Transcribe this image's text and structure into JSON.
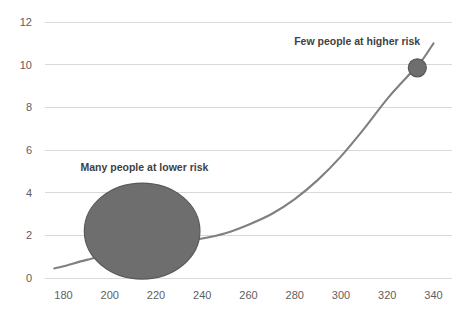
{
  "chart_data": {
    "type": "line",
    "title": "",
    "xlabel": "",
    "ylabel": "",
    "xlim": [
      172,
      348
    ],
    "ylim": [
      0,
      12
    ],
    "grid": true,
    "legend": false,
    "x_ticks": [
      180,
      200,
      220,
      240,
      260,
      280,
      300,
      320,
      340
    ],
    "y_ticks": [
      0,
      2,
      4,
      6,
      8,
      10,
      12
    ],
    "series": [
      {
        "name": "risk-curve",
        "color": "#808080",
        "x": [
          176,
          180,
          190,
          200,
          210,
          220,
          230,
          240,
          250,
          260,
          270,
          280,
          290,
          300,
          310,
          320,
          330,
          335,
          340
        ],
        "values": [
          0.45,
          0.55,
          0.85,
          1.1,
          1.35,
          1.55,
          1.7,
          1.85,
          2.1,
          2.5,
          3.0,
          3.7,
          4.6,
          5.7,
          7.0,
          8.4,
          9.6,
          10.2,
          11.0
        ]
      }
    ],
    "markers": [
      {
        "name": "high-risk-point",
        "x": 333,
        "y": 9.85,
        "color": "#6e6e6e",
        "radius_px": 9,
        "label": "Few people at higher risk"
      }
    ],
    "shapes": [
      {
        "name": "low-risk-population-ellipse",
        "type": "ellipse",
        "center_x": 214,
        "center_y": 2.2,
        "rx_units": 25,
        "ry_units": 2.25,
        "color": "#6e6e6e",
        "label": "Many people at lower risk"
      }
    ],
    "annotations": [
      {
        "text": "Many people at lower risk",
        "x": 215,
        "y": 5.0
      },
      {
        "text": "Few people at higher risk",
        "x": 307,
        "y": 10.9
      }
    ],
    "colors": {
      "gridline": "#d9d9d9",
      "tick_text": "#5e5e5e",
      "annotation_text": "#3f3f3f",
      "curve": "#808080",
      "shape_fill": "#6e6e6e",
      "shape_stroke": "#595959",
      "background": "#ffffff"
    }
  },
  "axes": {
    "y_tick_labels": [
      "0",
      "2",
      "4",
      "6",
      "8",
      "10",
      "12"
    ],
    "x_tick_labels": [
      "180",
      "200",
      "220",
      "240",
      "260",
      "280",
      "300",
      "320",
      "340"
    ]
  },
  "annotations": {
    "low_risk": "Many people at lower risk",
    "high_risk": "Few people at higher risk"
  }
}
